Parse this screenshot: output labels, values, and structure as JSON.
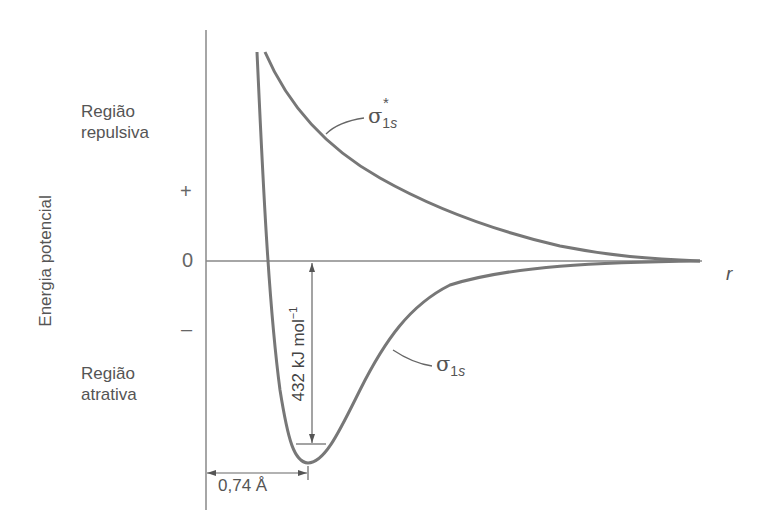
{
  "diagram": {
    "type": "potential-energy-curve",
    "y_axis_label": "Energia potencial",
    "x_axis_label": "r",
    "y_signs": {
      "plus": "+",
      "zero": "0",
      "minus": "–"
    },
    "regions": {
      "repulsive": {
        "line1": "Região",
        "line2": "repulsiva"
      },
      "attractive": {
        "line1": "Região",
        "line2": "atrativa"
      }
    },
    "curves": [
      {
        "name": "antibonding",
        "symbol": "σ",
        "subscript_num": "1",
        "subscript_letter": "s",
        "superscript": "*"
      },
      {
        "name": "bonding",
        "symbol": "σ",
        "subscript_num": "1",
        "subscript_letter": "s"
      }
    ],
    "annotations": {
      "bond_energy_value": "432 kJ mol",
      "bond_energy_exponent": "−1",
      "bond_length": "0,74 Å"
    },
    "colors": {
      "curve": "#777777",
      "axis": "#888888",
      "text": "#555555"
    }
  }
}
